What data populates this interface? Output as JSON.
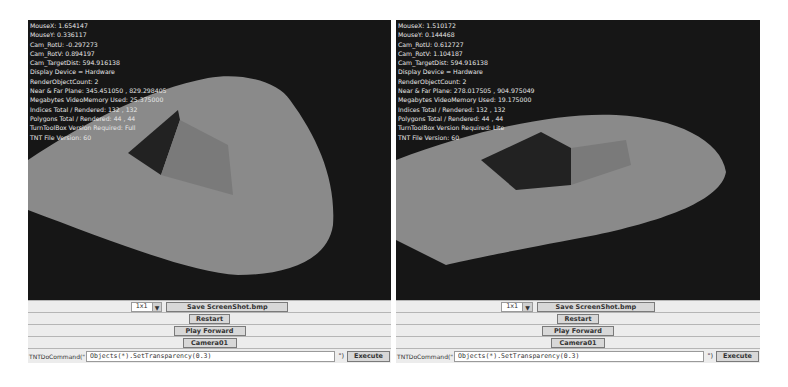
{
  "panels": [
    {
      "id": "left",
      "stats": [
        "MouseX: 1.654147",
        "MouseY: 0.336117",
        "Cam_RotU: -0.297273",
        "Cam_RotV: 0.894197",
        "Cam_TargetDist: 594.916138",
        "Display Device = Hardware",
        "RenderObjectCount: 2",
        "Near & Far Plane: 345.451050 , 829.298405",
        "Megabytes VideoMemory Used: 25.375000",
        "Indices Total / Rendered: 132 , 132",
        "Polygons Total / Rendered: 44 , 44",
        "TurnToolBox Version Required: Full",
        "TNT File Version: 60"
      ],
      "controls": {
        "size_select": "1x1",
        "save_screenshot": "Save ScreenShot.bmp",
        "restart": "Restart",
        "play_forward": "Play Forward",
        "camera": "Camera01",
        "command_label": "TNTDoCommand(\"",
        "command_value": "Objects(*).SetTransparency(0.3)",
        "command_suffix": "\")",
        "execute": "Execute"
      }
    },
    {
      "id": "right",
      "stats": [
        "MouseX: 1.510172",
        "MouseY: 0.144468",
        "Cam_RotU: 0.612727",
        "Cam_RotV: 1.104187",
        "Cam_TargetDist: 594.916138",
        "Display Device = Hardware",
        "RenderObjectCount: 2",
        "Near & Far Plane: 278.017505 , 904.975049",
        "Megabytes VideoMemory Used: 19.175000",
        "Indices Total / Rendered: 132 , 132",
        "Polygons Total / Rendered: 44 , 44",
        "TurnToolBox Version Required: Lite",
        "TNT File Version: 60"
      ],
      "controls": {
        "size_select": "1x1",
        "save_screenshot": "Save ScreenShot.bmp",
        "restart": "Restart",
        "play_forward": "Play Forward",
        "camera": "Camera01",
        "command_label": "TNTDoCommand(\"",
        "command_value": "Objects(*).SetTransparency(0.3)",
        "command_suffix": "\")",
        "execute": "Execute"
      }
    }
  ],
  "colors": {
    "viewport_bg": "#161616",
    "shape_fill": "#8a8a8a",
    "stats_text": "#e6e6e6",
    "control_bg": "#ececec"
  }
}
